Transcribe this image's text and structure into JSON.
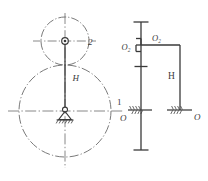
{
  "figure": {
    "type": "engineering-kinematic-diagram",
    "background_color": "#ffffff",
    "line_color": "#3a3a3a",
    "centerline_color": "#6b6b6b"
  },
  "left_view": {
    "name": "pitch-circle-schematic",
    "large_circle": {
      "label": "",
      "center_x": 65,
      "center_y": 111,
      "radius": 46,
      "line_style": "dash-dot"
    },
    "small_circle": {
      "label": "2",
      "center_x": 65,
      "center_y": 41,
      "radius": 24,
      "line_style": "dash-dot"
    },
    "arm_label": "H",
    "planet_label": "2",
    "pivot": {
      "name": "fixed-ground-pivot",
      "x": 65,
      "y": 111
    },
    "planet_joint": {
      "name": "planet-pin-joint",
      "x": 65,
      "y": 41
    }
  },
  "right_view": {
    "name": "kinematic-skeleton-diagram",
    "labels": {
      "o2_left": "O",
      "o2_left_sub": "2",
      "o2_right": "O",
      "o2_right_sub": "2",
      "arm": "H",
      "link_one": "1",
      "ground_left": "O",
      "ground_right": "O"
    },
    "left_column_x": 141,
    "right_column_x": 180,
    "top_y": 22,
    "bottom_y": 150,
    "ground_y": 110,
    "top_link_y": 45
  },
  "labels_all": [
    "2",
    "H",
    "O2",
    "O2",
    "H",
    "1",
    "O",
    "O"
  ]
}
